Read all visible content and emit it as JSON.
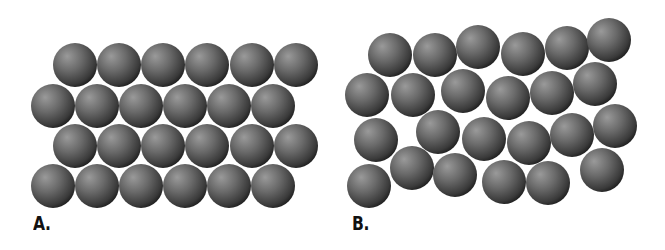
{
  "figure": {
    "background": "#ffffff",
    "sphere": {
      "radius": 22,
      "colors": {
        "highlight": "#9a9a9a",
        "mid": "#6a6a6a",
        "dark": "#3a3a3a",
        "edge": "#1c1c1c"
      }
    },
    "panels": [
      {
        "id": "A",
        "label": "A.",
        "label_pos": [
          33,
          214
        ],
        "description": "Regular, ordered close-packed arrangement",
        "rows": [
          {
            "y": 65,
            "x": [
              75,
              119,
              163,
              207,
              252,
              296
            ]
          },
          {
            "y": 106,
            "x": [
              53,
              97,
              141,
              185,
              229,
              273
            ]
          },
          {
            "y": 146,
            "x": [
              75,
              119,
              163,
              207,
              252,
              296
            ]
          },
          {
            "y": 186,
            "x": [
              53,
              97,
              141,
              185,
              229,
              273
            ]
          }
        ]
      },
      {
        "id": "B",
        "label": "B.",
        "label_pos": [
          352,
          214
        ],
        "description": "Irregular, disordered arrangement",
        "spheres": [
          [
            390,
            55
          ],
          [
            435,
            55
          ],
          [
            478,
            47
          ],
          [
            523,
            54
          ],
          [
            567,
            48
          ],
          [
            609,
            40
          ],
          [
            367,
            95
          ],
          [
            413,
            95
          ],
          [
            463,
            91
          ],
          [
            508,
            98
          ],
          [
            552,
            93
          ],
          [
            595,
            84
          ],
          [
            376,
            140
          ],
          [
            438,
            132
          ],
          [
            484,
            139
          ],
          [
            529,
            143
          ],
          [
            572,
            135
          ],
          [
            615,
            126
          ],
          [
            369,
            186
          ],
          [
            412,
            168
          ],
          [
            455,
            175
          ],
          [
            504,
            182
          ],
          [
            548,
            183
          ],
          [
            602,
            170
          ]
        ]
      }
    ]
  }
}
